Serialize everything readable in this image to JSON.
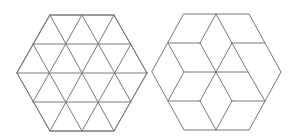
{
  "figure": {
    "background": "#ffffff",
    "stroke_color": "#7a7a7a",
    "stroke_width": 1
  },
  "shapes": [
    {
      "id": "triangle-grid-hexagon",
      "description": "Regular hexagon subdivided into 24 equilateral triangles",
      "outline": [
        [
          50,
          15
        ],
        [
          114,
          15
        ],
        [
          147,
          73
        ],
        [
          114,
          131
        ],
        [
          50,
          131
        ],
        [
          17,
          73
        ]
      ],
      "segments": [
        [
          [
            50,
            15
          ],
          [
            114,
            15
          ]
        ],
        [
          [
            33,
            44
          ],
          [
            131,
            44
          ]
        ],
        [
          [
            17,
            73
          ],
          [
            147,
            73
          ]
        ],
        [
          [
            33,
            102
          ],
          [
            131,
            102
          ]
        ],
        [
          [
            50,
            131
          ],
          [
            114,
            131
          ]
        ],
        [
          [
            50,
            15
          ],
          [
            17,
            73
          ]
        ],
        [
          [
            82,
            15
          ],
          [
            33,
            102
          ]
        ],
        [
          [
            114,
            15
          ],
          [
            50,
            131
          ]
        ],
        [
          [
            131,
            44
          ],
          [
            82,
            131
          ]
        ],
        [
          [
            147,
            73
          ],
          [
            114,
            131
          ]
        ],
        [
          [
            114,
            15
          ],
          [
            147,
            73
          ]
        ],
        [
          [
            82,
            15
          ],
          [
            131,
            102
          ]
        ],
        [
          [
            50,
            15
          ],
          [
            114,
            131
          ]
        ],
        [
          [
            33,
            44
          ],
          [
            82,
            131
          ]
        ],
        [
          [
            17,
            73
          ],
          [
            50,
            131
          ]
        ]
      ]
    },
    {
      "id": "rhombus-star-hexagon",
      "description": "Regular hexagon subdivided into 12 rhombi forming a six-point star pattern",
      "outline": [
        [
          184,
          14
        ],
        [
          249,
          14
        ],
        [
          281,
          72
        ],
        [
          249,
          130
        ],
        [
          184,
          130
        ],
        [
          152,
          72
        ]
      ],
      "segments": [
        [
          [
            216,
            14
          ],
          [
            200,
            43
          ]
        ],
        [
          [
            216,
            14
          ],
          [
            232,
            43
          ]
        ],
        [
          [
            168,
            43
          ],
          [
            200,
            43
          ]
        ],
        [
          [
            232,
            43
          ],
          [
            265,
            43
          ]
        ],
        [
          [
            200,
            43
          ],
          [
            216,
            72
          ]
        ],
        [
          [
            232,
            43
          ],
          [
            216,
            72
          ]
        ],
        [
          [
            168,
            43
          ],
          [
            184,
            72
          ]
        ],
        [
          [
            232,
            43
          ],
          [
            248,
            72
          ]
        ],
        [
          [
            184,
            72
          ],
          [
            216,
            72
          ]
        ],
        [
          [
            216,
            72
          ],
          [
            248,
            72
          ]
        ],
        [
          [
            184,
            72
          ],
          [
            168,
            101
          ]
        ],
        [
          [
            248,
            72
          ],
          [
            265,
            101
          ]
        ],
        [
          [
            216,
            72
          ],
          [
            200,
            101
          ]
        ],
        [
          [
            216,
            72
          ],
          [
            232,
            101
          ]
        ],
        [
          [
            168,
            101
          ],
          [
            200,
            101
          ]
        ],
        [
          [
            232,
            101
          ],
          [
            265,
            101
          ]
        ],
        [
          [
            200,
            101
          ],
          [
            216,
            130
          ]
        ],
        [
          [
            232,
            101
          ],
          [
            216,
            130
          ]
        ]
      ]
    }
  ]
}
